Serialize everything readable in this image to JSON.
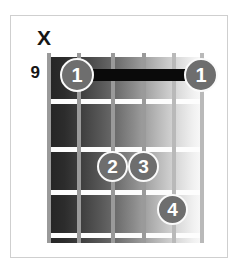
{
  "diagram": {
    "type": "guitar-chord-diagram",
    "starting_fret": "9",
    "string_count": 6,
    "fret_count": 4,
    "open_mute_markers": [
      {
        "string": 1,
        "symbol": "X",
        "meaning": "muted"
      }
    ],
    "barre": {
      "finger": "1",
      "fret": 1,
      "from_string": 2,
      "to_string": 6
    },
    "fingerings": [
      {
        "label": "1",
        "string": 2,
        "fret": 1
      },
      {
        "label": "1",
        "string": 6,
        "fret": 1
      },
      {
        "label": "2",
        "string": 3,
        "fret": 3
      },
      {
        "label": "3",
        "string": 4,
        "fret": 3
      },
      {
        "label": "4",
        "string": 5,
        "fret": 4
      }
    ],
    "colors": {
      "dot_fill": "#6e6e6e",
      "dot_text": "#ffffff",
      "barre": "#0a0a0a",
      "fret_line": "#fdfdfd",
      "string_line": "#9a9a9a",
      "frame_border": "#cfcfcf",
      "text": "#151515",
      "board_dark": "#242424",
      "board_light": "#fbfbfb"
    }
  }
}
